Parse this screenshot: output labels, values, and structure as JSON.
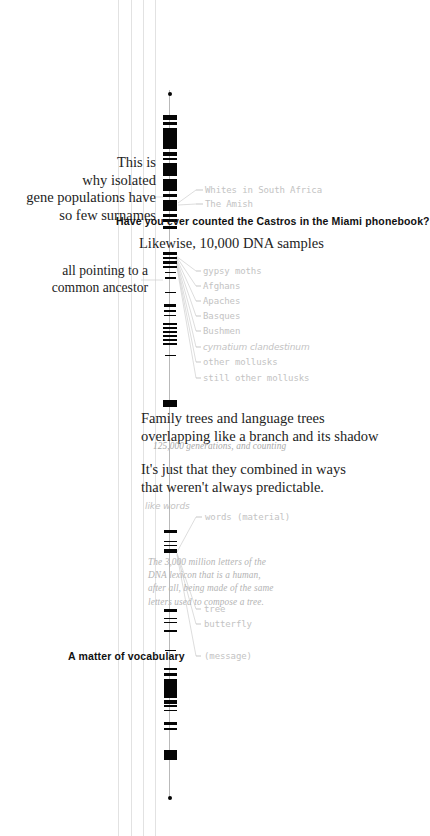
{
  "page": {
    "width": 411,
    "height": 836,
    "background": "#ffffff",
    "ink": "#050505",
    "annotation_color": "#c3c3c3",
    "note_color": "#b3b3b3",
    "rule_color": "#e2e2e2"
  },
  "statements": {
    "isolated_populations": "This is\nwhy isolated\ngene populations have\nso few surnames",
    "castros": "Have you ever counted the Castros in the Miami phonebook?",
    "likewise": "Likewise, 10,000 DNA samples",
    "common_ancestor": "all pointing to a\ncommon ancestor",
    "family_trees": "Family trees and language trees\noverlapping like a branch and its shadow",
    "generations": "125,000 generations, and counting",
    "combined": "It's just that they combined in ways\nthat weren't always predictable.",
    "dna_lexicon": "The 3,000 million letters of the\nDNA lexicon that is a human,\nafter all, being made of the same\nletters used to compose a tree.",
    "vocabulary": "A matter of vocabulary"
  },
  "annotations": {
    "group_top": [
      {
        "label": "Whites in South Africa"
      },
      {
        "label": "The Amish"
      }
    ],
    "group_samples": [
      {
        "label": "gypsy moths"
      },
      {
        "label": "Afghans"
      },
      {
        "label": "Apaches"
      },
      {
        "label": "Basques"
      },
      {
        "label": "Bushmen"
      },
      {
        "label": "cymatium clandestinum",
        "italic": true
      },
      {
        "label": "other mollusks"
      },
      {
        "label": "still other mollusks"
      }
    ],
    "group_words": [
      {
        "label": "words (material)"
      },
      {
        "label": "tree"
      },
      {
        "label": "butterfly"
      },
      {
        "label": "(message)"
      }
    ],
    "like_words": "like words"
  },
  "chart_data": {
    "type": "bar",
    "orientation": "vertical-stack",
    "axis": {
      "x": 170,
      "top": 92,
      "bottom": 798
    },
    "segments": [
      {
        "y": 92,
        "h": 4,
        "w": 4,
        "kind": "endcap-top"
      },
      {
        "y": 115,
        "h": 5,
        "w": 14
      },
      {
        "y": 122,
        "h": 3,
        "w": 14
      },
      {
        "y": 128,
        "h": 21,
        "w": 14
      },
      {
        "y": 152,
        "h": 4,
        "w": 14
      },
      {
        "y": 158,
        "h": 2,
        "w": 14
      },
      {
        "y": 163,
        "h": 13,
        "w": 14
      },
      {
        "y": 179,
        "h": 12,
        "w": 14
      },
      {
        "y": 194,
        "h": 3,
        "w": 14
      },
      {
        "y": 200,
        "h": 11,
        "w": 14
      },
      {
        "y": 214,
        "h": 3,
        "w": 14
      },
      {
        "y": 219,
        "h": 3,
        "w": 14
      },
      {
        "y": 226,
        "h": 3,
        "w": 14
      },
      {
        "y": 252,
        "h": 3,
        "w": 14
      },
      {
        "y": 257,
        "h": 2,
        "w": 14
      },
      {
        "y": 261,
        "h": 3,
        "w": 14
      },
      {
        "y": 266,
        "h": 2,
        "w": 14
      },
      {
        "y": 272,
        "h": 1,
        "w": 11
      },
      {
        "y": 277,
        "h": 2,
        "w": 11
      },
      {
        "y": 292,
        "h": 1,
        "w": 11
      },
      {
        "y": 304,
        "h": 3,
        "w": 12
      },
      {
        "y": 310,
        "h": 2,
        "w": 12
      },
      {
        "y": 315,
        "h": 1,
        "w": 12
      },
      {
        "y": 323,
        "h": 2,
        "w": 14
      },
      {
        "y": 327,
        "h": 2,
        "w": 14
      },
      {
        "y": 331,
        "h": 2,
        "w": 14
      },
      {
        "y": 335,
        "h": 2,
        "w": 14
      },
      {
        "y": 339,
        "h": 2,
        "w": 14
      },
      {
        "y": 343,
        "h": 2,
        "w": 14
      },
      {
        "y": 355,
        "h": 1,
        "w": 11
      },
      {
        "y": 400,
        "h": 7,
        "w": 14
      },
      {
        "y": 530,
        "h": 3,
        "w": 13
      },
      {
        "y": 541,
        "h": 1,
        "w": 13
      },
      {
        "y": 545,
        "h": 1,
        "w": 13
      },
      {
        "y": 549,
        "h": 4,
        "w": 13
      },
      {
        "y": 609,
        "h": 3,
        "w": 13
      },
      {
        "y": 618,
        "h": 1,
        "w": 13
      },
      {
        "y": 622,
        "h": 1,
        "w": 13
      },
      {
        "y": 630,
        "h": 2,
        "w": 13
      },
      {
        "y": 650,
        "h": 1,
        "w": 11
      },
      {
        "y": 668,
        "h": 2,
        "w": 13
      },
      {
        "y": 673,
        "h": 3,
        "w": 13
      },
      {
        "y": 679,
        "h": 19,
        "w": 13
      },
      {
        "y": 700,
        "h": 4,
        "w": 13
      },
      {
        "y": 705,
        "h": 2,
        "w": 13
      },
      {
        "y": 710,
        "h": 1,
        "w": 13
      },
      {
        "y": 722,
        "h": 3,
        "w": 13
      },
      {
        "y": 728,
        "h": 2,
        "w": 13
      },
      {
        "y": 750,
        "h": 10,
        "w": 13
      },
      {
        "y": 796,
        "h": 4,
        "w": 4,
        "kind": "endcap-bottom"
      }
    ],
    "guide_rules_x": [
      118,
      131,
      143,
      155
    ],
    "ylim": [
      90,
      800
    ],
    "grid": false,
    "legend": "none"
  }
}
